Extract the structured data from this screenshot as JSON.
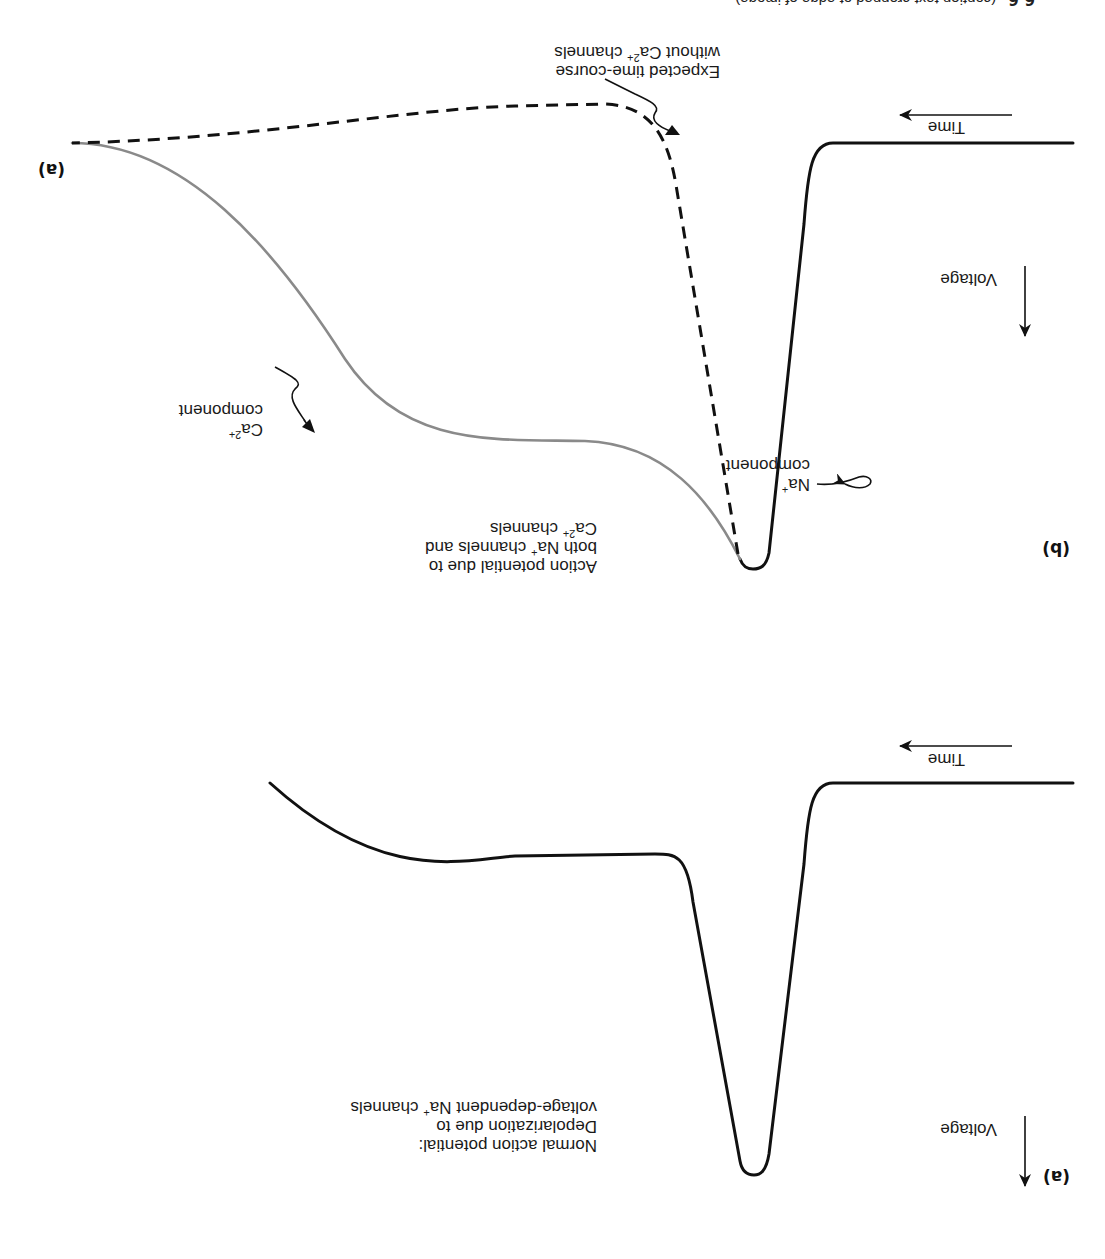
{
  "figure": {
    "orientation": "rotated 180 degrees",
    "caption_strip": {
      "figure_number": "6.6",
      "text": "(caption text cropped at edge of image)"
    },
    "panels": [
      {
        "id": "a",
        "label": "(a)",
        "axes": {
          "x_label": "Time",
          "y_label": "Voltage"
        },
        "annotation": {
          "line1": "Normal action potential:",
          "line2": "Depolarization due to",
          "line3_pre": "voltage-dependent Na",
          "line3_sup": "+",
          "line3_post": " channels"
        },
        "traces": [
          {
            "name": "Normal action potential",
            "style": "solid",
            "color": "#111111"
          }
        ]
      },
      {
        "id": "b",
        "label": "(b)",
        "axes": {
          "x_label": "Time",
          "y_label": "Voltage"
        },
        "annotations": {
          "main": {
            "line1": "Action potential due to",
            "line2_pre": "both Na",
            "line2_sup": "+",
            "line2_post": " channels and",
            "line3_pre": "Ca",
            "line3_sup": "2+",
            "line3_post": " channels"
          },
          "na_component": {
            "line1_pre": "Na",
            "line1_sup": "+",
            "line2": "component"
          },
          "ca_component": {
            "line1_pre": "Ca",
            "line1_sup": "2+",
            "line2": "component"
          },
          "expected": {
            "line1": "Expected time-course",
            "line2_pre": "without Ca",
            "line2_sup": "2+",
            "line2_post": " channels"
          }
        },
        "traces": [
          {
            "name": "Na+ component (solid)",
            "style": "solid",
            "color": "#111111"
          },
          {
            "name": "Ca2+ component (plateau)",
            "style": "solid",
            "color": "#888888"
          },
          {
            "name": "Expected time-course without Ca2+ channels",
            "style": "dashed",
            "color": "#111111"
          }
        ]
      }
    ]
  }
}
